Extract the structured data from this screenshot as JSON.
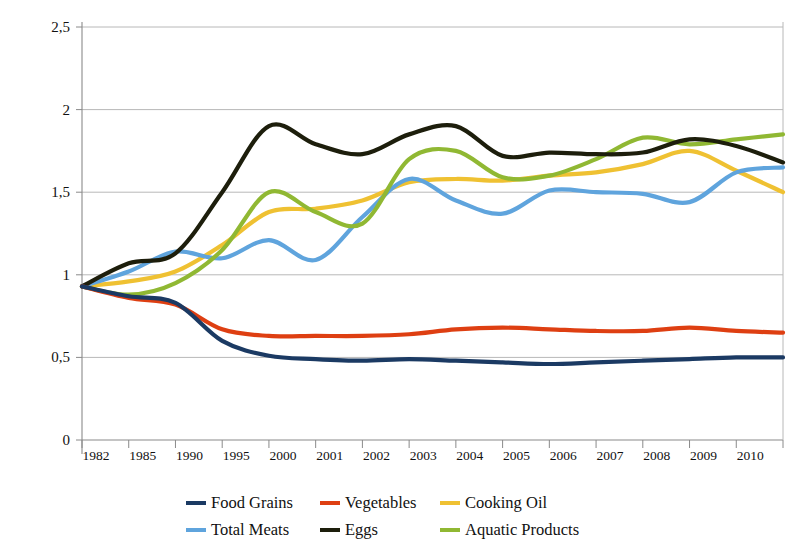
{
  "chart_data": {
    "type": "line",
    "title": "",
    "xlabel": "",
    "ylabel": "% change with respect to 1981 reference value",
    "ylim": [
      0,
      2.5
    ],
    "yticks": [
      0,
      0.5,
      1,
      1.5,
      2,
      2.5
    ],
    "ytick_labels": [
      "0",
      "0,5",
      "1",
      "1,5",
      "2",
      "2,5"
    ],
    "grid": true,
    "legend_position": "bottom",
    "decimal_separator": ",",
    "categories": [
      "1982",
      "1985",
      "1990",
      "1995",
      "2000",
      "2001",
      "2002",
      "2003",
      "2004",
      "2005",
      "2006",
      "2007",
      "2008",
      "2009",
      "2010",
      "2011"
    ],
    "x": [
      1982,
      1985,
      1990,
      1995,
      2000,
      2001,
      2002,
      2003,
      2004,
      2005,
      2006,
      2007,
      2008,
      2009,
      2010,
      2011
    ],
    "series": [
      {
        "name": "Food Grains",
        "color": "#1b3a63",
        "values": [
          0.93,
          0.87,
          0.83,
          0.6,
          0.51,
          0.49,
          0.48,
          0.49,
          0.48,
          0.47,
          0.46,
          0.47,
          0.48,
          0.49,
          0.5,
          0.5
        ]
      },
      {
        "name": "Vegetables",
        "color": "#de3f12",
        "values": [
          0.93,
          0.86,
          0.82,
          0.67,
          0.63,
          0.63,
          0.63,
          0.64,
          0.67,
          0.68,
          0.67,
          0.66,
          0.66,
          0.68,
          0.66,
          0.65
        ]
      },
      {
        "name": "Cooking Oil",
        "color": "#efc132",
        "values": [
          0.93,
          0.96,
          1.02,
          1.18,
          1.38,
          1.4,
          1.45,
          1.56,
          1.58,
          1.57,
          1.6,
          1.62,
          1.67,
          1.75,
          1.63,
          1.5
        ]
      },
      {
        "name": "Total Meats",
        "color": "#5fa4dd",
        "values": [
          0.93,
          1.02,
          1.14,
          1.1,
          1.21,
          1.09,
          1.35,
          1.58,
          1.45,
          1.37,
          1.51,
          1.5,
          1.49,
          1.44,
          1.62,
          1.65
        ]
      },
      {
        "name": "Eggs",
        "color": "#1d1e0c",
        "values": [
          0.93,
          1.07,
          1.13,
          1.5,
          1.9,
          1.79,
          1.73,
          1.85,
          1.9,
          1.72,
          1.74,
          1.73,
          1.74,
          1.82,
          1.78,
          1.68
        ]
      },
      {
        "name": "Aquatic Products",
        "color": "#90b833",
        "values": [
          0.93,
          0.88,
          0.95,
          1.15,
          1.5,
          1.38,
          1.31,
          1.7,
          1.75,
          1.59,
          1.6,
          1.7,
          1.83,
          1.79,
          1.82,
          1.85
        ]
      }
    ]
  },
  "axis": {
    "y_title": "% change with respect to 1981 reference value",
    "y_tick_labels": [
      "2,5",
      "2",
      "1,5",
      "1",
      "0,5",
      "0"
    ],
    "x_tick_labels": [
      "1982",
      "1985",
      "1990",
      "1995",
      "2000",
      "2001",
      "2002",
      "2003",
      "2004",
      "2005",
      "2006",
      "2007",
      "2008",
      "2009",
      "2010"
    ]
  },
  "legend": {
    "items": [
      {
        "label": "Food Grains",
        "color": "#1b3a63"
      },
      {
        "label": "Vegetables",
        "color": "#de3f12"
      },
      {
        "label": "Cooking Oil",
        "color": "#efc132"
      },
      {
        "label": "Total Meats",
        "color": "#5fa4dd"
      },
      {
        "label": "Eggs",
        "color": "#1d1e0c"
      },
      {
        "label": "Aquatic Products",
        "color": "#90b833"
      }
    ]
  }
}
